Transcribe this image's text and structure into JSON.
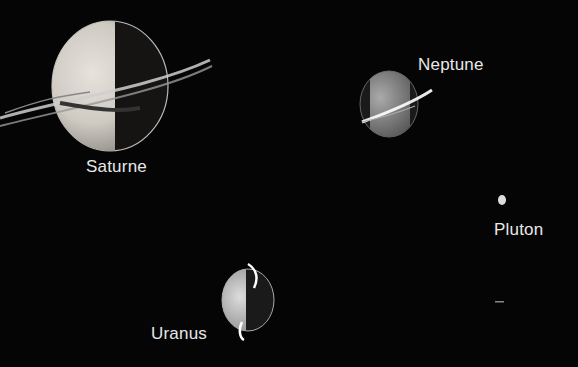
{
  "scene": {
    "background": "#050505",
    "planets": [
      {
        "name": "Saturne",
        "label_x": 86,
        "label_y": 157
      },
      {
        "name": "Neptune",
        "label_x": 418,
        "label_y": 55
      },
      {
        "name": "Pluton",
        "label_x": 494,
        "label_y": 220
      },
      {
        "name": "Uranus",
        "label_x": 151,
        "label_y": 324
      }
    ]
  }
}
